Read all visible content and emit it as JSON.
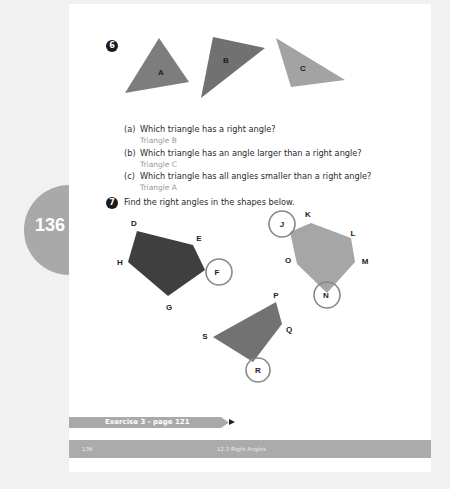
{
  "side_tab": {
    "page_number": "136"
  },
  "question6": {
    "number": "6",
    "triangles": [
      {
        "label": "A",
        "color": "#7d7d7d"
      },
      {
        "label": "B",
        "color": "#717171"
      },
      {
        "label": "C",
        "color": "#a3a3a3"
      }
    ],
    "parts": [
      {
        "letter": "(a)",
        "question": "Which triangle has a right angle?",
        "answer": "Triangle B"
      },
      {
        "letter": "(b)",
        "question": "Which triangle has an angle larger than a right angle?",
        "answer": "Triangle C"
      },
      {
        "letter": "(c)",
        "question": "Which triangle has all angles smaller than a right angle?",
        "answer": "Triangle A"
      }
    ]
  },
  "question7": {
    "number": "7",
    "instruction": "Find the right angles in the shapes below.",
    "pentagon": {
      "color": "#3f3f3f",
      "vertices": [
        "D",
        "E",
        "F",
        "G",
        "H"
      ],
      "circled": [
        "F"
      ]
    },
    "hexagon": {
      "color": "#a6a6a6",
      "vertices": [
        "J",
        "K",
        "L",
        "M",
        "N",
        "O"
      ],
      "circled": [
        "J",
        "N"
      ]
    },
    "quadrilateral": {
      "color": "#727272",
      "vertices": [
        "P",
        "Q",
        "R",
        "S"
      ],
      "circled": [
        "R"
      ]
    }
  },
  "exercise_link": {
    "label": "Exercise 3 - page 121"
  },
  "footer": {
    "page": "136",
    "title": "12.3 Right Angles"
  }
}
